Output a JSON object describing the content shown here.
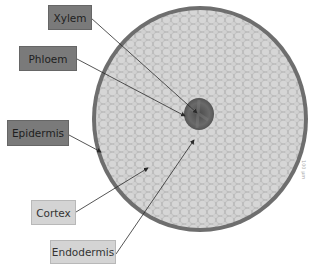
{
  "diagram": {
    "labels": [
      {
        "id": "xylem",
        "text": "Xylem",
        "style": "dark"
      },
      {
        "id": "phloem",
        "text": "Phloem",
        "style": "dark"
      },
      {
        "id": "epidermis",
        "text": "Epidermis",
        "style": "dark"
      },
      {
        "id": "cortex",
        "text": "Cortex",
        "style": "light"
      },
      {
        "id": "endodermis",
        "text": "Endodermis",
        "style": "light"
      }
    ],
    "scale_text": "100 µm"
  },
  "colors": {
    "dark_label": "#7a7a7a",
    "light_label": "#d4d4d4",
    "cortex_fill": "#c9c9c9",
    "epidermis_ring": "#6e6e6e",
    "vascular_core": "#5a5a5a",
    "arrow": "#2a2a2a"
  }
}
